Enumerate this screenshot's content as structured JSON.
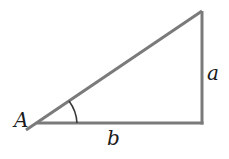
{
  "diagram": {
    "type": "right-triangle",
    "stroke_color": "#7a7a7a",
    "label_color": "#1a1a1a",
    "labels": {
      "angle": "A",
      "opposite_side": "a",
      "adjacent_side": "b"
    }
  }
}
